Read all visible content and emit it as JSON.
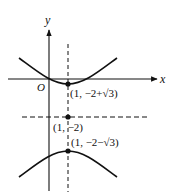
{
  "diagram": {
    "type": "hyperbola-graph",
    "axes": {
      "x_label": "x",
      "y_label": "y",
      "origin_label": "O"
    },
    "points": [
      {
        "label": "(1, −2+√3)",
        "role": "upper-vertex"
      },
      {
        "label": "(1, −2)",
        "role": "center"
      },
      {
        "label": "(1, −2−√3)",
        "role": "lower-vertex"
      }
    ],
    "asymptote_lines": [
      {
        "role": "vertical",
        "equation": "x = 1"
      },
      {
        "role": "horizontal",
        "equation": "y = −2"
      }
    ],
    "colors": {
      "stroke": "#111111",
      "background": "#ffffff"
    }
  }
}
